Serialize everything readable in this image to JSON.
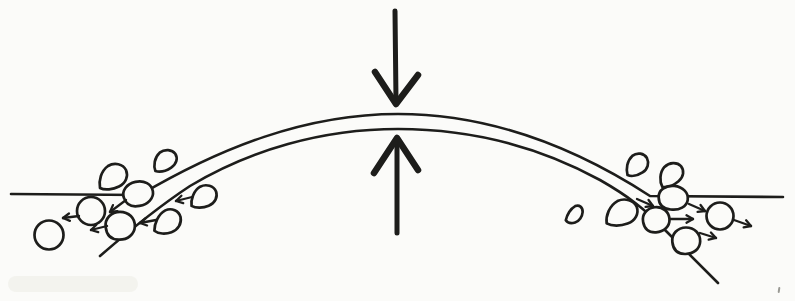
{
  "figure": {
    "name": "dome-compression-lateral-particle-flow-diagram",
    "canvas": {
      "width": 795,
      "height": 301,
      "background": "#fbfbf9",
      "ink": "#1d1d1b"
    },
    "membrane": {
      "stroke_width": 2.6,
      "top_path": "M 11 194 L 140 195 C 220 148 305 114 398 114 C 491 114 576 148 650 196 L 783 197",
      "bottom_path": "M 100 256 C 130 230 158 207 190 186 C 250 150 322 129 398 129 C 478 129 545 150 600 180 C 628 196 645 209 666 231 L 718 283"
    },
    "compression_arrows": {
      "shaft_width": 5,
      "head_width": 6.5,
      "items": [
        {
          "name": "compression-arrow-down",
          "shaft": [
            395,
            11,
            396,
            101
          ],
          "head": [
            [
              375,
              72
            ],
            [
              396,
              104
            ],
            [
              418,
              75
            ]
          ]
        },
        {
          "name": "compression-arrow-up",
          "shaft": [
            397,
            233,
            397,
            141
          ],
          "head": [
            [
              374,
              173
            ],
            [
              397,
              138
            ],
            [
              418,
              170
            ]
          ]
        }
      ]
    },
    "particles": {
      "stroke_width": 2.7,
      "fill": "#fbfbf9",
      "shape_paths": {
        "teardrop": "M -13 12 C -14.5 5 -12 -5 -5 -10 C 1.5 -14 10 -12 13 -6 C 15.5 0 13 7 6 10.5 C 0 13.5 -8 14.5 -13 12 Z",
        "blob": "M -13 1 C -14 -7 -8 -13.5 0 -13.5 C 8 -13.5 13.8 -7.5 13.5 0.5 C 13.2 8 7 13.2 -1 13 C -8.5 12.8 -12.3 8.5 -13 1 Z"
      },
      "items": [
        {
          "name": "vesicle-circle-left-outer",
          "type": "circle",
          "cx": 49,
          "cy": 235,
          "r": 14.5
        },
        {
          "name": "vesicle-circle-left-inner",
          "type": "circle",
          "cx": 91,
          "cy": 211,
          "r": 14
        },
        {
          "name": "vesicle-blob-left-junction",
          "type": "blob",
          "cx": 138,
          "cy": 194,
          "sx": 1.12,
          "sy": 0.92,
          "rot": -12
        },
        {
          "name": "vesicle-blob-left-lower",
          "type": "blob",
          "cx": 120,
          "cy": 226,
          "sx": 1.1,
          "sy": 1.05,
          "rot": 0
        },
        {
          "name": "vesicle-teardrop-left-upper",
          "type": "teardrop",
          "cx": 113,
          "cy": 176,
          "sx": 1,
          "sy": 1,
          "rot": 0
        },
        {
          "name": "vesicle-teardrop-left-top",
          "type": "teardrop",
          "cx": 165,
          "cy": 160,
          "sx": 0.85,
          "sy": 0.8,
          "rot": -8
        },
        {
          "name": "vesicle-teardrop-left-mid",
          "type": "teardrop",
          "cx": 204,
          "cy": 196,
          "sx": 0.9,
          "sy": 0.9,
          "rot": 4
        },
        {
          "name": "vesicle-teardrop-left-lower",
          "type": "teardrop",
          "cx": 168,
          "cy": 221,
          "sx": 0.9,
          "sy": 1,
          "rot": 10
        },
        {
          "name": "vesicle-teardrop-right-top",
          "type": "teardrop",
          "cx": 637,
          "cy": 164,
          "sx": 0.8,
          "sy": 0.85,
          "rot": -5
        },
        {
          "name": "vesicle-teardrop-right-upper",
          "type": "teardrop",
          "cx": 671,
          "cy": 174,
          "sx": 0.9,
          "sy": 0.85,
          "rot": -15
        },
        {
          "name": "vesicle-teardrop-right-mid",
          "type": "teardrop",
          "cx": 622,
          "cy": 212,
          "sx": 1.1,
          "sy": 1.05,
          "rot": 5
        },
        {
          "name": "vesicle-teardrop-right-small",
          "type": "teardrop",
          "cx": 575,
          "cy": 214,
          "sx": 0.5,
          "sy": 0.75,
          "rot": 20
        },
        {
          "name": "vesicle-blob-right-junction",
          "type": "blob",
          "cx": 673,
          "cy": 198,
          "sx": 1.1,
          "sy": 0.9,
          "rot": 6
        },
        {
          "name": "vesicle-blob-right-mid",
          "type": "blob",
          "cx": 656,
          "cy": 220,
          "sx": 1.0,
          "sy": 0.95,
          "rot": -5
        },
        {
          "name": "vesicle-blob-right-lower",
          "type": "blob",
          "cx": 686,
          "cy": 241,
          "sx": 1.05,
          "sy": 1.0,
          "rot": 0
        },
        {
          "name": "vesicle-circle-right-outer",
          "type": "circle",
          "cx": 720,
          "cy": 216,
          "r": 13.5
        }
      ]
    },
    "flow_arrows": {
      "stroke_width": 2.3,
      "head_len": 7.5,
      "head_angle_deg": 30,
      "items": [
        {
          "name": "flow-arrow-left-1",
          "x1": 126,
          "y1": 200,
          "x2": 110,
          "y2": 212
        },
        {
          "name": "flow-arrow-left-2",
          "x1": 79,
          "y1": 216,
          "x2": 63,
          "y2": 218
        },
        {
          "name": "flow-arrow-left-3",
          "x1": 107,
          "y1": 226,
          "x2": 91,
          "y2": 230
        },
        {
          "name": "flow-arrow-left-4",
          "x1": 156,
          "y1": 220,
          "x2": 140,
          "y2": 223
        },
        {
          "name": "flow-arrow-left-5",
          "x1": 192,
          "y1": 197,
          "x2": 176,
          "y2": 201
        },
        {
          "name": "flow-arrow-right-1",
          "x1": 637,
          "y1": 199,
          "x2": 653,
          "y2": 206
        },
        {
          "name": "flow-arrow-right-2",
          "x1": 689,
          "y1": 204,
          "x2": 705,
          "y2": 211
        },
        {
          "name": "flow-arrow-right-3",
          "x1": 670,
          "y1": 219,
          "x2": 693,
          "y2": 219
        },
        {
          "name": "flow-arrow-right-4",
          "x1": 700,
          "y1": 233,
          "x2": 716,
          "y2": 238
        },
        {
          "name": "flow-arrow-right-5",
          "x1": 734,
          "y1": 220,
          "x2": 751,
          "y2": 226
        }
      ]
    },
    "artifacts": [
      {
        "name": "scan-speck",
        "type": "speck",
        "x": 778,
        "y": 287,
        "w": 2,
        "h": 6,
        "color": "#8f8f8a",
        "rot": 8,
        "opacity": 0.9
      },
      {
        "name": "scan-smudge",
        "type": "smudge",
        "x": 8,
        "y": 276,
        "w": 130,
        "h": 16,
        "color": "#efefe9",
        "rot": 0,
        "opacity": 0.7
      }
    ]
  }
}
